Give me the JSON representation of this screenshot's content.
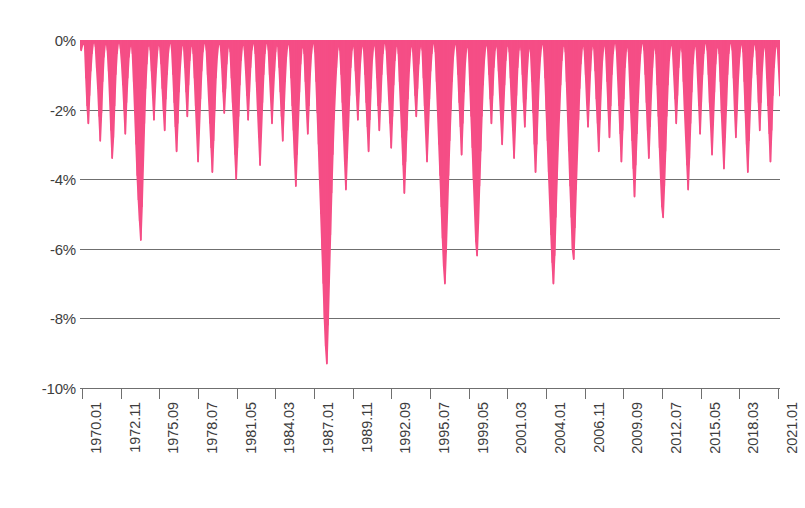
{
  "chart_data": {
    "type": "area",
    "title": "",
    "subtitle": "",
    "xlabel": "",
    "ylabel": "",
    "ylim": [
      -10,
      0
    ],
    "ytick_labels": [
      "0%",
      "-2%",
      "-4%",
      "-6%",
      "-8%",
      "-10%"
    ],
    "ytick_values": [
      0,
      -2,
      -4,
      -6,
      -8,
      -10
    ],
    "grid": true,
    "legend": null,
    "series_color": "#f54e86",
    "axis_color": "#6f6f6f",
    "label_color": "#3d3d3d",
    "background": "#ffffff",
    "x_start": "1970.01",
    "x_end": "2022.12",
    "xtick_labels": [
      "1970.01",
      "1972.11",
      "1975.09",
      "1978.07",
      "1981.05",
      "1984.03",
      "1987.01",
      "1989.11",
      "1992.09",
      "1995.07",
      "1999.05",
      "2001.03",
      "2004.01",
      "2006.11",
      "2009.09",
      "2012.07",
      "2015.05",
      "2018.03",
      "2021.01"
    ],
    "values": [
      -0.1,
      -0.3,
      -0.15,
      0,
      -0.2,
      -1.1,
      -1.9,
      -2.4,
      -1.6,
      -0.9,
      -0.4,
      -0.1,
      0,
      -0.2,
      -0.8,
      -1.4,
      -2.2,
      -2.9,
      -2.1,
      -1.2,
      -0.5,
      -0.15,
      0,
      -0.3,
      -0.9,
      -1.7,
      -2.6,
      -3.4,
      -2.8,
      -1.9,
      -1.0,
      -0.4,
      -0.1,
      0,
      -0.25,
      -0.7,
      -1.3,
      -2.0,
      -2.7,
      -1.8,
      -1.1,
      -0.5,
      -0.2,
      0,
      -0.4,
      -1.2,
      -2.1,
      -3.0,
      -3.9,
      -4.6,
      -5.2,
      -5.75,
      -4.8,
      -3.6,
      -2.4,
      -1.4,
      -0.7,
      -0.2,
      0,
      -0.3,
      -0.9,
      -1.6,
      -2.3,
      -1.5,
      -0.8,
      -0.3,
      0,
      -0.2,
      -0.7,
      -1.4,
      -2.0,
      -2.6,
      -1.7,
      -1.0,
      -0.4,
      -0.1,
      0,
      -0.3,
      -1.0,
      -1.8,
      -2.5,
      -3.2,
      -2.4,
      -1.5,
      -0.8,
      -0.3,
      0,
      -0.2,
      -0.8,
      -1.5,
      -2.2,
      -1.3,
      -0.6,
      -0.2,
      0,
      -0.4,
      -1.1,
      -1.9,
      -2.7,
      -3.5,
      -2.6,
      -1.7,
      -0.9,
      -0.35,
      -0.1,
      0,
      -0.3,
      -1.0,
      -1.7,
      -2.4,
      -3.1,
      -3.8,
      -2.9,
      -2.0,
      -1.1,
      -0.5,
      -0.15,
      0,
      -0.25,
      -0.8,
      -1.5,
      -2.1,
      -1.4,
      -0.7,
      -0.25,
      0,
      -0.35,
      -1.1,
      -1.8,
      -2.5,
      -3.3,
      -4.0,
      -3.1,
      -2.2,
      -1.3,
      -0.6,
      -0.2,
      0,
      -0.3,
      -0.9,
      -1.6,
      -2.3,
      -1.5,
      -0.8,
      -0.3,
      -0.1,
      0,
      -0.4,
      -1.2,
      -2.0,
      -2.8,
      -3.6,
      -2.7,
      -1.8,
      -1.0,
      -0.4,
      -0.1,
      0,
      -0.3,
      -1.0,
      -1.7,
      -2.4,
      -1.6,
      -0.9,
      -0.35,
      0,
      -0.2,
      -0.8,
      -1.5,
      -2.2,
      -2.9,
      -2.0,
      -1.2,
      -0.5,
      -0.15,
      0,
      -0.3,
      -1.1,
      -1.9,
      -2.6,
      -3.4,
      -4.2,
      -3.3,
      -2.4,
      -1.5,
      -0.7,
      -0.25,
      0,
      -0.4,
      -1.2,
      -2.0,
      -2.7,
      -1.9,
      -1.0,
      -0.4,
      -0.1,
      0,
      -0.35,
      -1.2,
      -2.1,
      -3.0,
      -4.0,
      -5.0,
      -6.0,
      -7.0,
      -8.0,
      -8.8,
      -9.3,
      -8.2,
      -6.9,
      -5.6,
      -4.4,
      -3.3,
      -2.3,
      -1.5,
      -0.8,
      -0.3,
      0,
      -0.3,
      -1.0,
      -1.8,
      -2.6,
      -3.5,
      -4.3,
      -3.4,
      -2.5,
      -1.6,
      -0.8,
      -0.3,
      0,
      -0.25,
      -0.9,
      -1.6,
      -2.3,
      -1.5,
      -0.7,
      -0.25,
      0,
      -0.3,
      -1.0,
      -1.8,
      -2.5,
      -3.2,
      -2.3,
      -1.4,
      -0.6,
      -0.2,
      0,
      -0.35,
      -1.1,
      -1.9,
      -2.6,
      -1.8,
      -1.0,
      -0.4,
      -0.1,
      0,
      -0.3,
      -1.0,
      -1.7,
      -2.4,
      -3.1,
      -2.2,
      -1.3,
      -0.6,
      -0.2,
      0,
      -0.4,
      -1.2,
      -2.0,
      -2.8,
      -3.6,
      -4.4,
      -3.5,
      -2.6,
      -1.7,
      -0.9,
      -0.35,
      0,
      -0.25,
      -0.9,
      -1.6,
      -2.2,
      -1.4,
      -0.7,
      -0.25,
      0,
      -0.3,
      -1.1,
      -1.9,
      -2.7,
      -3.5,
      -2.6,
      -1.7,
      -0.9,
      -0.4,
      -0.1,
      0,
      -0.35,
      -1.2,
      -2.1,
      -3.0,
      -3.9,
      -4.8,
      -5.7,
      -6.5,
      -7.0,
      -6.1,
      -5.0,
      -3.9,
      -2.9,
      -2.0,
      -1.2,
      -0.5,
      -0.15,
      0,
      -0.3,
      -1.0,
      -1.8,
      -2.5,
      -3.3,
      -2.4,
      -1.5,
      -0.7,
      -0.25,
      0,
      -0.4,
      -1.3,
      -2.2,
      -3.1,
      -4.0,
      -4.9,
      -5.8,
      -6.2,
      -5.3,
      -4.2,
      -3.2,
      -2.2,
      -1.3,
      -0.6,
      -0.2,
      0,
      -0.3,
      -1.0,
      -1.7,
      -2.4,
      -1.6,
      -0.8,
      -0.3,
      0,
      -0.25,
      -0.9,
      -1.6,
      -2.3,
      -3.0,
      -2.1,
      -1.3,
      -0.6,
      -0.2,
      0,
      -0.35,
      -1.1,
      -1.9,
      -2.6,
      -3.4,
      -2.5,
      -1.6,
      -0.8,
      -0.3,
      0,
      -0.3,
      -1.0,
      -1.8,
      -2.5,
      -1.7,
      -0.9,
      -0.35,
      0,
      -0.4,
      -1.2,
      -2.1,
      -3.0,
      -3.8,
      -3.0,
      -2.0,
      -1.1,
      -0.5,
      -0.15,
      0,
      -0.3,
      -1.1,
      -2.0,
      -2.9,
      -3.8,
      -4.7,
      -5.6,
      -6.4,
      -7.0,
      -6.2,
      -5.1,
      -4.0,
      -3.0,
      -2.1,
      -1.3,
      -0.6,
      -0.2,
      0,
      -0.35,
      -1.2,
      -2.2,
      -3.2,
      -4.2,
      -5.1,
      -6.0,
      -6.3,
      -5.4,
      -4.3,
      -3.3,
      -2.3,
      -1.4,
      -0.7,
      -0.25,
      0,
      -0.3,
      -1.0,
      -1.8,
      -2.5,
      -1.7,
      -0.9,
      -0.3,
      0,
      -0.25,
      -0.9,
      -1.7,
      -2.4,
      -3.2,
      -2.3,
      -1.4,
      -0.6,
      -0.2,
      0,
      -0.4,
      -1.2,
      -2.0,
      -2.8,
      -1.9,
      -1.0,
      -0.4,
      -0.1,
      0,
      -0.3,
      -1.1,
      -1.9,
      -2.7,
      -3.5,
      -2.6,
      -1.7,
      -0.8,
      -0.3,
      0,
      -0.35,
      -1.2,
      -2.1,
      -2.9,
      -3.7,
      -4.5,
      -3.6,
      -2.7,
      -1.8,
      -1.0,
      -0.4,
      -0.1,
      0,
      -0.3,
      -1.0,
      -1.8,
      -2.6,
      -3.4,
      -2.5,
      -1.6,
      -0.8,
      -0.3,
      0,
      -0.4,
      -1.3,
      -2.2,
      -3.1,
      -4.0,
      -4.8,
      -5.1,
      -4.2,
      -3.2,
      -2.2,
      -1.3,
      -0.6,
      -0.2,
      0,
      -0.3,
      -1.0,
      -1.7,
      -2.4,
      -1.6,
      -0.8,
      -0.3,
      0,
      -0.35,
      -1.2,
      -2.0,
      -2.8,
      -3.6,
      -4.3,
      -3.4,
      -2.4,
      -1.5,
      -0.7,
      -0.25,
      0,
      -0.3,
      -1.1,
      -1.9,
      -2.7,
      -1.8,
      -1.0,
      -0.4,
      -0.1,
      0,
      -0.3,
      -1.0,
      -1.8,
      -2.5,
      -3.3,
      -2.4,
      -1.5,
      -0.7,
      -0.25,
      0,
      -0.4,
      -1.2,
      -2.1,
      -2.9,
      -3.7,
      -2.8,
      -1.9,
      -1.0,
      -0.4,
      -0.1,
      0,
      -0.3,
      -1.1,
      -2.0,
      -2.8,
      -2.0,
      -1.1,
      -0.5,
      -0.15,
      0,
      -0.35,
      -1.2,
      -2.1,
      -3.0,
      -3.8,
      -2.9,
      -2.0,
      -1.1,
      -0.5,
      -0.15,
      0,
      -0.3,
      -1.0,
      -1.8,
      -2.6,
      -1.8,
      -0.9,
      -0.35,
      0,
      -0.3,
      -1.1,
      -1.9,
      -2.7,
      -3.5,
      -2.6,
      -1.6,
      -0.8,
      -0.3,
      0,
      -0.25,
      -0.9,
      -1.6
    ]
  }
}
